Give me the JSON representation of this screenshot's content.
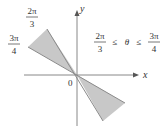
{
  "figure": {
    "axes": {
      "x_label": "x",
      "y_label": "y",
      "origin_label": "0"
    },
    "angle_labels": {
      "upper": {
        "numerator": "2π",
        "denominator": "3"
      },
      "lower": {
        "numerator": "3π",
        "denominator": "4"
      }
    },
    "inequality": {
      "left": {
        "numerator": "2π",
        "denominator": "3"
      },
      "op1": "≤",
      "variable": "θ",
      "op2": "≤",
      "right": {
        "numerator": "3π",
        "denominator": "4"
      }
    },
    "colors": {
      "region_fill": "#c8c8c8",
      "region_edge": "#8a8a8a",
      "axis": "#888888",
      "text": "#333333",
      "background": "#ffffff"
    }
  }
}
